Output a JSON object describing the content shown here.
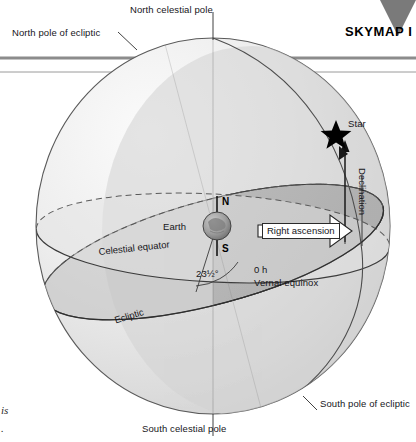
{
  "page": {
    "title": "SKYMAP I",
    "width": 416,
    "height": 442,
    "background": "#ffffff"
  },
  "header": {
    "skymap_label": "SKYMAP I",
    "marker_icon": "down-triangle-icon",
    "marker_color": "#7a7a7a"
  },
  "diagram": {
    "type": "celestial-sphere",
    "sphere_fill_light": "#ececec",
    "sphere_fill_dark": "#b0b0b0",
    "outline_color": "#3a3a3a",
    "labels": {
      "north_celestial_pole": "North celestial pole",
      "north_pole_of_ecliptic": "North pole of ecliptic",
      "south_celestial_pole": "South celestial pole",
      "south_pole_of_ecliptic": "South pole of ecliptic",
      "celestial_equator": "Celestial equator",
      "ecliptic": "Ecliptic",
      "earth": "Earth",
      "north_axis": "N",
      "south_axis": "S",
      "obliquity_angle": "23½°",
      "vernal_hour": "0 h",
      "vernal_equinox": "Vernal equinox",
      "right_ascension": "Right ascension",
      "declination": "Declination",
      "star": "Star"
    },
    "icons": {
      "star": "star-icon",
      "earth": "earth-globe-icon",
      "right_ascension_arrow": "block-arrow-right-icon",
      "declination_arrow": "arrow-up-icon"
    }
  },
  "margin_text": {
    "fragment_1": "is",
    "fragment_2": "."
  }
}
